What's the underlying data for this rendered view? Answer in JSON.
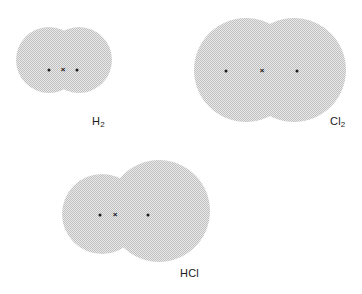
{
  "figure": {
    "background_color": "#ffffff",
    "cloud_fill_color": "#d4d4d4",
    "cloud_pattern": "dithered-halftone-gray",
    "marker_color": "#1b1b1b",
    "width": 362,
    "height": 294
  },
  "molecules": [
    {
      "id": "h2",
      "label_text": "H",
      "label_subscript": "2",
      "label_full": "H2",
      "description": "Two small overlapping spherical electron clouds forming a peanut shape",
      "label_x": 92,
      "label_y": 116,
      "cloud": {
        "x": 16,
        "y": 24,
        "width": 96,
        "height": 72,
        "lobes": [
          {
            "cx": 33,
            "cy": 36,
            "r": 33
          },
          {
            "cx": 63,
            "cy": 36,
            "r": 33
          }
        ]
      },
      "electrons": [
        {
          "type": "dot",
          "symbol": "•",
          "x": 49,
          "y": 70,
          "name": "electron-dot-left"
        },
        {
          "type": "cross",
          "symbol": "×",
          "x": 63,
          "y": 70,
          "name": "electron-cross-shared"
        },
        {
          "type": "dot",
          "symbol": "•",
          "x": 77,
          "y": 70,
          "name": "electron-dot-right"
        }
      ]
    },
    {
      "id": "cl2",
      "label_text": "Cl",
      "label_subscript": "2",
      "label_full": "Cl2",
      "description": "Two large overlapping spherical electron clouds forming a wide peanut shape",
      "label_x": 330,
      "label_y": 116,
      "cloud": {
        "x": 194,
        "y": 14,
        "width": 152,
        "height": 112,
        "lobes": [
          {
            "cx": 52,
            "cy": 56,
            "r": 52
          },
          {
            "cx": 100,
            "cy": 56,
            "r": 52
          }
        ]
      },
      "electrons": [
        {
          "type": "dot",
          "symbol": "•",
          "x": 226,
          "y": 71,
          "name": "electron-dot-left"
        },
        {
          "type": "cross",
          "symbol": "×",
          "x": 262,
          "y": 71,
          "name": "electron-cross-shared"
        },
        {
          "type": "dot",
          "symbol": "•",
          "x": 297,
          "y": 71,
          "name": "electron-dot-right"
        }
      ]
    },
    {
      "id": "hcl",
      "label_text": "HCl",
      "label_subscript": "",
      "label_full": "HCl",
      "description": "Small hydrogen electron cloud overlapping a large chlorine electron cloud, asymmetric shape",
      "label_x": 180,
      "label_y": 268,
      "cloud": {
        "x": 62,
        "y": 160,
        "width": 148,
        "height": 104,
        "lobes": [
          {
            "cx": 40,
            "cy": 54,
            "r": 40
          },
          {
            "cx": 97,
            "cy": 51,
            "r": 51
          }
        ]
      },
      "electrons": [
        {
          "type": "dot",
          "symbol": "•",
          "x": 100,
          "y": 215,
          "name": "electron-dot-hydrogen"
        },
        {
          "type": "cross",
          "symbol": "×",
          "x": 115,
          "y": 215,
          "name": "electron-cross-shared"
        },
        {
          "type": "dot",
          "symbol": "•",
          "x": 148,
          "y": 215,
          "name": "electron-dot-chlorine"
        }
      ]
    }
  ]
}
